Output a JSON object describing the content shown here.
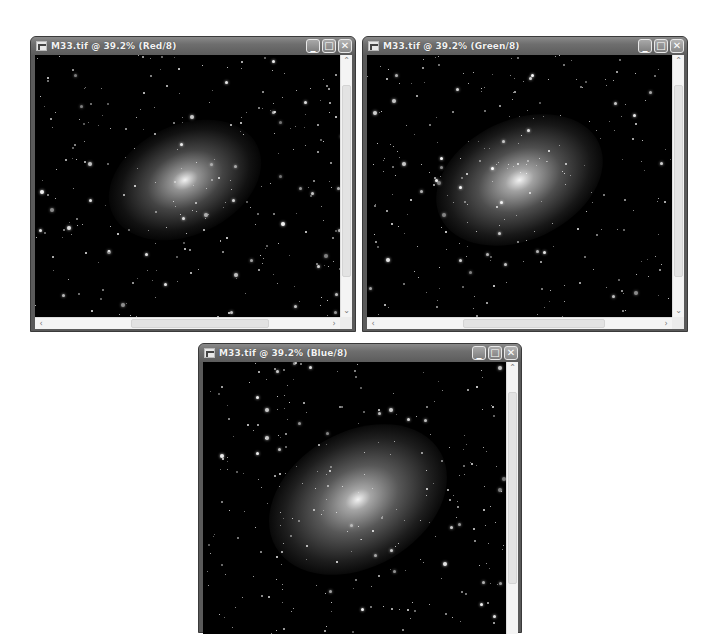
{
  "windows": [
    {
      "id": "red",
      "title": "M33.tif @ 39.2% (Red/8)",
      "channel": "Red",
      "zoom": "39.2%",
      "bit_depth": "8",
      "geometry": {
        "x": 30,
        "y": 36,
        "w": 326,
        "h": 296
      }
    },
    {
      "id": "green",
      "title": "M33.tif @ 39.2% (Green/8)",
      "channel": "Green",
      "zoom": "39.2%",
      "bit_depth": "8",
      "geometry": {
        "x": 362,
        "y": 36,
        "w": 326,
        "h": 296
      }
    },
    {
      "id": "blue",
      "title": "M33.tif @ 39.2% (Blue/8)",
      "channel": "Blue",
      "zoom": "39.2%",
      "bit_depth": "8",
      "geometry": {
        "x": 198,
        "y": 343,
        "w": 324,
        "h": 280
      }
    }
  ],
  "controls": {
    "minimize": "_",
    "maximize": "□",
    "close": "✕",
    "scroll_up": "⌃",
    "scroll_down": "⌄",
    "scroll_left": "‹",
    "scroll_right": "›"
  },
  "icons": {
    "app_icon": "photoshop-document-icon"
  }
}
